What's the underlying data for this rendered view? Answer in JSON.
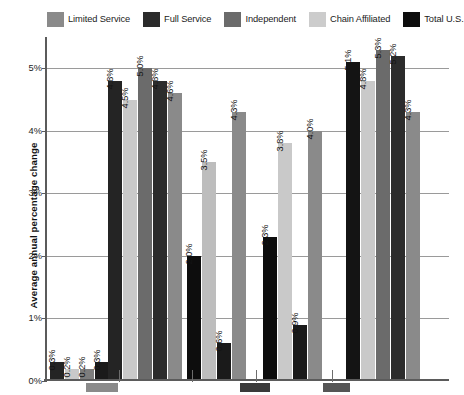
{
  "chart_data": {
    "type": "bar",
    "title": "",
    "subtitle": "",
    "xlabel": "",
    "ylabel": "Average annual percentage change",
    "ylim": [
      0,
      5.5
    ],
    "ytick_values": [
      0,
      1,
      2,
      3,
      4,
      5
    ],
    "ytick_labels": [
      "0%",
      "1%",
      "2%",
      "3%",
      "4%",
      "5%"
    ],
    "grid": true,
    "legend_position": "top",
    "value_label_format": "0.0%",
    "value_labels_rotated": true,
    "categories": [
      "Group 1",
      "Group 2",
      "Group 3",
      "Group 4",
      "Group 5"
    ],
    "series": [
      {
        "name": "Limited Service",
        "color": "#7d7d7d",
        "values": [
          0.3,
          4.8,
          null,
          null,
          5.1
        ]
      },
      {
        "name": "Full Service",
        "color": "#242424",
        "values": [
          0.2,
          4.5,
          2.0,
          2.3,
          4.8
        ]
      },
      {
        "name": "Independent",
        "color": "#5e5e5e",
        "values": [
          0.2,
          5.0,
          3.5,
          3.8,
          5.3
        ]
      },
      {
        "name": "Chain Affiliated",
        "color": "#c9c9c9",
        "values": [
          0.3,
          4.8,
          0.6,
          0.9,
          5.2
        ]
      },
      {
        "name": "Total U.S.",
        "color": "#0d0d0d",
        "values": [
          null,
          4.6,
          4.3,
          4.0,
          4.3
        ]
      }
    ],
    "bars": [
      {
        "group": 1,
        "items": [
          {
            "series": "Limited Service",
            "value": 0.3,
            "label": "0.3%",
            "color": "#242424"
          },
          {
            "series": "Full Service",
            "value": 0.2,
            "label": "0.2%",
            "color": "#c9c9c9"
          },
          {
            "series": "Independent",
            "value": 0.2,
            "label": "0.2%",
            "color": "#7d7d7d"
          },
          {
            "series": "Chain Affiliated",
            "value": 0.3,
            "label": "0.3%",
            "color": "#1a1a1a"
          }
        ]
      },
      {
        "group": 2,
        "items": [
          {
            "series": "Limited Service",
            "value": 4.8,
            "label": "4.8%",
            "color": "#242424"
          },
          {
            "series": "Full Service",
            "value": 4.5,
            "label": "4.5%",
            "color": "#c9c9c9"
          },
          {
            "series": "Independent",
            "value": 5.0,
            "label": "5.0%",
            "color": "#6b6b6b"
          },
          {
            "series": "Chain Affiliated",
            "value": 4.8,
            "label": "4.8%",
            "color": "#2c2c2c"
          },
          {
            "series": "Total U.S.",
            "value": 4.6,
            "label": "4.6%",
            "color": "#8a8a8a"
          }
        ]
      },
      {
        "group": 3,
        "items": [
          {
            "series": "Limited Service",
            "value": 2.0,
            "label": "2.0%",
            "color": "#0d0d0d"
          },
          {
            "series": "Full Service",
            "value": 3.5,
            "label": "3.5%",
            "color": "#bdbdbd"
          },
          {
            "series": "Independent",
            "value": 0.6,
            "label": "0.6%",
            "color": "#1a1a1a"
          },
          {
            "series": "Chain Affiliated",
            "value": 4.3,
            "label": "4.3%",
            "color": "#8a8a8a"
          }
        ]
      },
      {
        "group": 4,
        "items": [
          {
            "series": "Limited Service",
            "value": 2.3,
            "label": "2.3%",
            "color": "#0d0d0d"
          },
          {
            "series": "Full Service",
            "value": 3.8,
            "label": "3.8%",
            "color": "#c9c9c9"
          },
          {
            "series": "Independent",
            "value": 0.9,
            "label": "0.9%",
            "color": "#1a1a1a"
          },
          {
            "series": "Chain Affiliated",
            "value": 4.0,
            "label": "4.0%",
            "color": "#8a8a8a"
          }
        ]
      },
      {
        "group": 5,
        "items": [
          {
            "series": "Limited Service",
            "value": 5.1,
            "label": "5.1%",
            "color": "#141414"
          },
          {
            "series": "Full Service",
            "value": 4.8,
            "label": "4.8%",
            "color": "#c9c9c9"
          },
          {
            "series": "Independent",
            "value": 5.3,
            "label": "5.3%",
            "color": "#6b6b6b"
          },
          {
            "series": "Chain Affiliated",
            "value": 5.2,
            "label": "5.2%",
            "color": "#2c2c2c"
          },
          {
            "series": "Total U.S.",
            "value": 4.3,
            "label": "4.3%",
            "color": "#8a8a8a"
          }
        ]
      }
    ]
  },
  "legend": {
    "items": [
      {
        "label": "Limited Service",
        "color": "#8a8a8a"
      },
      {
        "label": "Full Service",
        "color": "#2b2b2b"
      },
      {
        "label": "Independent",
        "color": "#6b6b6b"
      },
      {
        "label": "Chain Affiliated",
        "color": "#cccccc"
      },
      {
        "label": "Total U.S.",
        "color": "#0d0d0d"
      }
    ]
  },
  "axis": {
    "y_title": "Average annual percentage change",
    "y_ticks": [
      "5%",
      "4%",
      "3%",
      "2%",
      "1%",
      "0%"
    ]
  }
}
